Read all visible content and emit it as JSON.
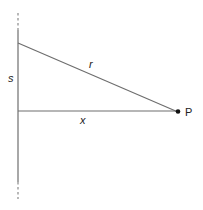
{
  "diagram": {
    "labels": {
      "s": "s",
      "r": "r",
      "x": "x",
      "point": "P"
    },
    "colors": {
      "line": "#6e6e6e",
      "point": "#111111",
      "text": "#222222"
    }
  }
}
